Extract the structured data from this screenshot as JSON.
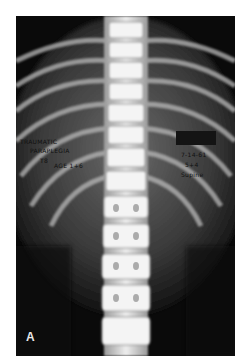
{
  "image": {
    "type": "radiograph",
    "view": "anteroposterior thoracolumbar spine",
    "panel_label": "A"
  },
  "annotations": {
    "left": [
      "TRAUMATIC",
      "PARAPLEGIA",
      "T8",
      "AGE 1+6"
    ],
    "right": [
      "7-14-61",
      "5+4",
      "Supine"
    ],
    "redaction_box": true
  },
  "colors": {
    "background": "#ffffff",
    "film": "#0a0a0a",
    "bone": "#e6e6e6",
    "text": "#111111"
  }
}
